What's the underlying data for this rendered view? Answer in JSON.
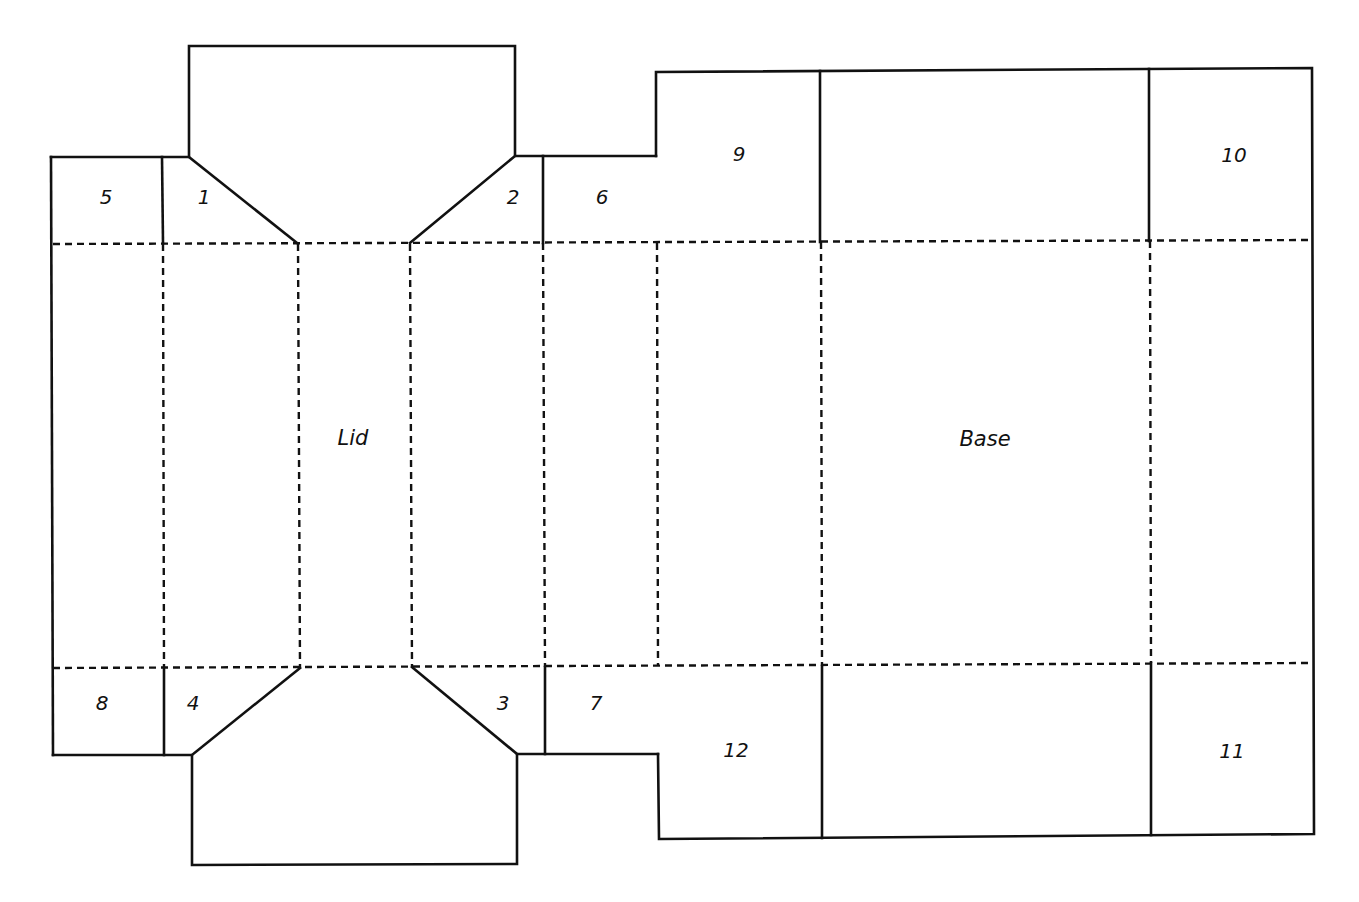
{
  "diagram": {
    "type": "box-net-template",
    "colors": {
      "line": "#111111",
      "background": "#ffffff"
    },
    "panels": {
      "lid": {
        "label": "Lid"
      },
      "base": {
        "label": "Base"
      }
    },
    "flaps": [
      {
        "id": "flap-1",
        "label": "1"
      },
      {
        "id": "flap-2",
        "label": "2"
      },
      {
        "id": "flap-3",
        "label": "3"
      },
      {
        "id": "flap-4",
        "label": "4"
      },
      {
        "id": "flap-5",
        "label": "5"
      },
      {
        "id": "flap-6",
        "label": "6"
      },
      {
        "id": "flap-7",
        "label": "7"
      },
      {
        "id": "flap-8",
        "label": "8"
      },
      {
        "id": "flap-9",
        "label": "9"
      },
      {
        "id": "flap-10",
        "label": "10"
      },
      {
        "id": "flap-11",
        "label": "11"
      },
      {
        "id": "flap-12",
        "label": "12"
      }
    ],
    "legend": {
      "solid_line": "cut",
      "dashed_line": "fold"
    }
  }
}
